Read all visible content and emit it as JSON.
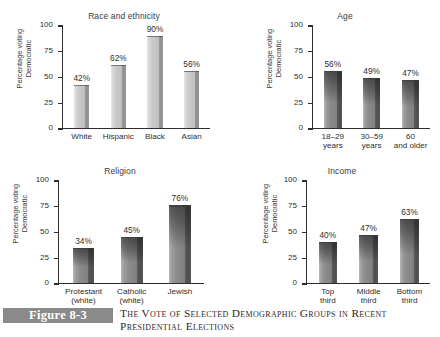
{
  "figure": {
    "badge": "Figure 8-3",
    "caption": "The Vote of Selected Demographic Groups in Recent Presidential Elections"
  },
  "axis": {
    "ylabel_line1": "Percentage voting",
    "ylabel_line2": "Democratic",
    "ticks": [
      "100",
      "75",
      "50",
      "25",
      "0"
    ]
  },
  "chart_data": [
    {
      "type": "bar",
      "title": "Race and ethnicity",
      "xlabel": "",
      "ylabel": "Percentage voting Democratic",
      "ylim": [
        0,
        100
      ],
      "yticks": [
        0,
        25,
        50,
        75,
        100
      ],
      "grid": false,
      "legend": "none",
      "bar_style": "light",
      "categories": [
        "White",
        "Hispanic",
        "Black",
        "Asian"
      ],
      "category_lines": [
        [
          "White"
        ],
        [
          "Hispanic"
        ],
        [
          "Black"
        ],
        [
          "Asian"
        ]
      ],
      "values": [
        42,
        62,
        90,
        56
      ],
      "data_labels": [
        "42%",
        "62%",
        "90%",
        "56%"
      ]
    },
    {
      "type": "bar",
      "title": "Age",
      "xlabel": "",
      "ylabel": "Percentage voting Democratic",
      "ylim": [
        0,
        100
      ],
      "yticks": [
        0,
        25,
        50,
        75,
        100
      ],
      "grid": false,
      "legend": "none",
      "bar_style": "dark",
      "categories": [
        "18–29 years",
        "30–59 years",
        "60 and older"
      ],
      "category_lines": [
        [
          "18–29",
          "years"
        ],
        [
          "30–59",
          "years"
        ],
        [
          "60",
          "and older"
        ]
      ],
      "values": [
        56,
        49,
        47
      ],
      "data_labels": [
        "56%",
        "49%",
        "47%"
      ]
    },
    {
      "type": "bar",
      "title": "Religion",
      "xlabel": "",
      "ylabel": "Percentage voting Democratic",
      "ylim": [
        0,
        100
      ],
      "yticks": [
        0,
        25,
        50,
        75,
        100
      ],
      "grid": false,
      "legend": "none",
      "bar_style": "dark",
      "categories": [
        "Protestant (white)",
        "Catholic (white)",
        "Jewish"
      ],
      "category_lines": [
        [
          "Protestant",
          "(white)"
        ],
        [
          "Catholic",
          "(white)"
        ],
        [
          "Jewish"
        ]
      ],
      "values": [
        34,
        45,
        76
      ],
      "data_labels": [
        "34%",
        "45%",
        "76%"
      ]
    },
    {
      "type": "bar",
      "title": "Income",
      "xlabel": "",
      "ylabel": "Percentage voting Democratic",
      "ylim": [
        0,
        100
      ],
      "yticks": [
        0,
        25,
        50,
        75,
        100
      ],
      "grid": false,
      "legend": "none",
      "bar_style": "dark",
      "categories": [
        "Top third",
        "Middle third",
        "Bottom third"
      ],
      "category_lines": [
        [
          "Top",
          "third"
        ],
        [
          "Middle",
          "third"
        ],
        [
          "Bottom",
          "third"
        ]
      ],
      "values": [
        40,
        47,
        63
      ],
      "data_labels": [
        "40%",
        "47%",
        "63%"
      ]
    }
  ],
  "colors": {
    "axis": "#2e2e2e",
    "text": "#2e2e2e",
    "badge_background": "#8a8a8a",
    "badge_text": "#ffffff",
    "bar_light": "#c9c9c9",
    "bar_dark": "#848484",
    "page_background": "#ffffff"
  }
}
